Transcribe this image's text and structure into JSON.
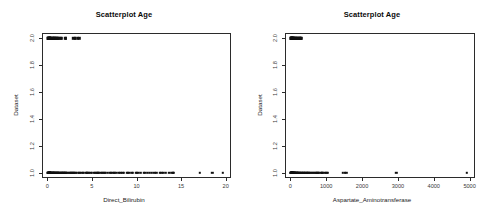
{
  "figure": {
    "background_color": "#ffffff",
    "point_color": "#111111",
    "axis_color": "#2b2b2b",
    "panel_count": 2
  },
  "chart_data": [
    {
      "type": "scatter",
      "title": "Scatterplot Age",
      "xlabel": "Direct_Bilirubin",
      "ylabel": "Dataset",
      "xlim": [
        -0.6,
        20.6
      ],
      "ylim": [
        0.96,
        2.04
      ],
      "grid": false,
      "legend": null,
      "xticks": [
        0,
        5,
        10,
        15,
        20
      ],
      "xticklabels": [
        "0",
        "5",
        "10",
        "15",
        "20"
      ],
      "yticks": [
        1.0,
        1.2,
        1.4,
        1.6,
        1.8,
        2.0
      ],
      "yticklabels": [
        "1.0",
        "1.2",
        "1.4",
        "1.6",
        "1.8",
        "2.0"
      ],
      "series": [
        {
          "name": "Dataset = 1",
          "y": 1.0,
          "x": [
            0.1,
            0.1,
            0.1,
            0.1,
            0.1,
            0.2,
            0.2,
            0.2,
            0.2,
            0.2,
            0.2,
            0.3,
            0.3,
            0.3,
            0.3,
            0.3,
            0.4,
            0.4,
            0.4,
            0.4,
            0.5,
            0.5,
            0.5,
            0.5,
            0.6,
            0.6,
            0.6,
            0.7,
            0.7,
            0.7,
            0.8,
            0.8,
            0.9,
            0.9,
            1.0,
            1.0,
            1.1,
            1.1,
            1.2,
            1.2,
            1.3,
            1.3,
            1.4,
            1.4,
            1.5,
            1.5,
            1.6,
            1.6,
            1.7,
            1.8,
            1.8,
            1.9,
            2.0,
            2.0,
            2.1,
            2.2,
            2.3,
            2.4,
            2.5,
            2.6,
            2.7,
            2.8,
            2.9,
            3.0,
            3.1,
            3.2,
            3.3,
            3.5,
            3.6,
            3.8,
            4.0,
            4.1,
            4.3,
            4.4,
            4.5,
            4.6,
            4.8,
            5.0,
            5.2,
            5.3,
            5.5,
            5.6,
            5.7,
            5.8,
            6.0,
            6.1,
            6.2,
            6.4,
            6.5,
            6.8,
            7.0,
            7.1,
            7.3,
            7.5,
            7.6,
            7.8,
            8.0,
            8.2,
            8.4,
            8.6,
            8.9,
            9.0,
            9.2,
            9.5,
            9.6,
            9.9,
            10.0,
            10.2,
            10.5,
            10.8,
            11.0,
            11.3,
            11.5,
            11.7,
            12.0,
            12.2,
            12.6,
            12.8,
            13.0,
            13.3,
            13.7,
            14.0,
            14.1,
            14.2,
            17.1,
            18.5,
            19.7
          ]
        },
        {
          "name": "Dataset = 2",
          "y": 2.0,
          "x": [
            0.1,
            0.1,
            0.1,
            0.1,
            0.2,
            0.2,
            0.2,
            0.2,
            0.3,
            0.3,
            0.3,
            0.4,
            0.4,
            0.4,
            0.5,
            0.5,
            0.6,
            0.6,
            0.7,
            0.7,
            0.8,
            0.8,
            0.9,
            1.0,
            1.0,
            1.1,
            1.2,
            1.3,
            1.4,
            1.5,
            1.6,
            2.0,
            2.1,
            2.9,
            3.1,
            3.2,
            3.4,
            3.6
          ]
        }
      ]
    },
    {
      "type": "scatter",
      "title": "Scatterplot Age",
      "xlabel": "Aspartate_Aminotransferase",
      "ylabel": "Dataset",
      "xlim": [
        -150,
        5150
      ],
      "ylim": [
        0.96,
        2.04
      ],
      "grid": false,
      "legend": null,
      "xticks": [
        0,
        1000,
        2000,
        3000,
        4000,
        5000
      ],
      "xticklabels": [
        "0",
        "1000",
        "2000",
        "3000",
        "4000",
        "5000"
      ],
      "yticks": [
        1.0,
        1.2,
        1.4,
        1.6,
        1.8,
        2.0
      ],
      "yticklabels": [
        "1.0",
        "1.2",
        "1.4",
        "1.6",
        "1.8",
        "2.0"
      ],
      "series": [
        {
          "name": "Dataset = 1",
          "y": 1.0,
          "x": [
            10,
            15,
            18,
            20,
            22,
            25,
            28,
            30,
            32,
            35,
            38,
            40,
            42,
            45,
            48,
            50,
            55,
            58,
            60,
            65,
            68,
            70,
            75,
            80,
            85,
            90,
            95,
            100,
            105,
            110,
            115,
            120,
            130,
            140,
            150,
            160,
            170,
            180,
            190,
            200,
            210,
            225,
            240,
            255,
            270,
            285,
            300,
            320,
            340,
            360,
            380,
            400,
            420,
            440,
            460,
            480,
            500,
            520,
            545,
            570,
            600,
            630,
            660,
            690,
            720,
            750,
            780,
            800,
            850,
            870,
            890,
            910,
            960,
            990,
            1020,
            1050,
            1460,
            1510,
            1560,
            2950,
            4929
          ]
        },
        {
          "name": "Dataset = 2",
          "y": 2.0,
          "x": [
            10,
            14,
            18,
            22,
            26,
            30,
            34,
            38,
            42,
            46,
            50,
            56,
            62,
            68,
            74,
            80,
            88,
            96,
            104,
            112,
            120,
            132,
            144,
            158,
            172,
            186,
            200,
            215,
            230,
            245,
            260,
            275,
            290,
            300
          ]
        }
      ]
    }
  ]
}
